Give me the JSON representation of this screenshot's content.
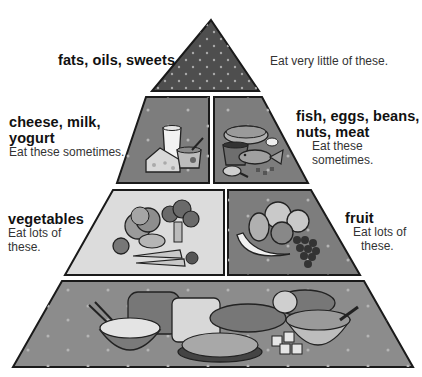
{
  "colors": {
    "outline": "#1a1a1a",
    "top_fill": "#4e4e4e",
    "dark_fill": "#7d7d7d",
    "light_fill": "#dcdcdc",
    "base_fill": "#8c8c8c",
    "dot": "#a8a8a8"
  },
  "tiers": [
    {
      "id": "fats",
      "title": "fats, oils, sweets",
      "desc": "Eat very little of these."
    },
    {
      "id": "dairy",
      "title_line1": "cheese, milk,",
      "title_line2": "yogurt",
      "desc": "Eat these sometimes.",
      "illustration": "glass of milk, cheese wedge, yogurt cup"
    },
    {
      "id": "protein",
      "title_line1": "fish, eggs, beans,",
      "title_line2": "nuts, meat",
      "desc_line1": "Eat these",
      "desc_line2": "sometimes.",
      "illustration": "ham, bowl of beans, fish, chicken drumstick, egg, nuts"
    },
    {
      "id": "vegetables",
      "title": "vegetables",
      "desc_line1": "Eat lots of",
      "desc_line2": "these.",
      "illustration": "lettuce, broccoli, tomato, potato, carrots"
    },
    {
      "id": "fruit",
      "title": "fruit",
      "desc_line1": "Eat lots of",
      "desc_line2": "these.",
      "illustration": "banana, pear, orange, apple, grapes"
    },
    {
      "id": "grains",
      "illustration": "bowl of rice, bread loaf, baguette, pasta plate, crackers, cereal bowl"
    }
  ]
}
